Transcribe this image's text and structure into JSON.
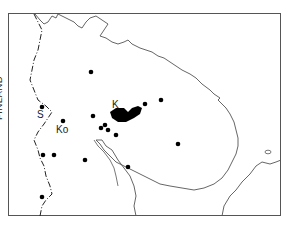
{
  "map": {
    "labels": {
      "country": "FINLAND",
      "s": "S",
      "ko": "Ko",
      "k": "K"
    },
    "colors": {
      "frame": "#555555",
      "coast": "#555555",
      "border": "#222222",
      "dots": "#000000"
    },
    "sites": [
      {
        "x": 91,
        "y": 72
      },
      {
        "x": 42,
        "y": 107
      },
      {
        "x": 63,
        "y": 121
      },
      {
        "x": 93,
        "y": 116
      },
      {
        "x": 101,
        "y": 128
      },
      {
        "x": 105,
        "y": 125
      },
      {
        "x": 108,
        "y": 130
      },
      {
        "x": 116,
        "y": 135
      },
      {
        "x": 145,
        "y": 104
      },
      {
        "x": 161,
        "y": 100
      },
      {
        "x": 178,
        "y": 144
      },
      {
        "x": 43,
        "y": 155
      },
      {
        "x": 54,
        "y": 155
      },
      {
        "x": 85,
        "y": 160
      },
      {
        "x": 128,
        "y": 167
      },
      {
        "x": 42,
        "y": 197
      }
    ]
  }
}
